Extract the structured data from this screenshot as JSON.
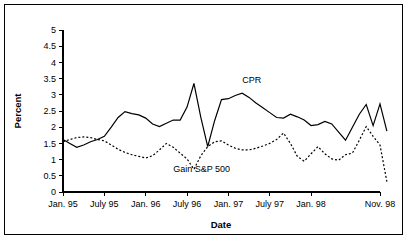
{
  "chart_data": {
    "type": "line",
    "title": "",
    "xlabel": "Date",
    "ylabel": "Percent",
    "ylim": [
      0,
      5
    ],
    "ytick_labels": [
      "0",
      "0.5",
      "1",
      "1.5",
      "2",
      "2.5",
      "3",
      "3.5",
      "4",
      "4.5",
      "5"
    ],
    "ytick_values": [
      0,
      0.5,
      1,
      1.5,
      2,
      2.5,
      3,
      3.5,
      4,
      4.5,
      5
    ],
    "xtick_labels": [
      "Jan. 95",
      "July 95",
      "Jan. 96",
      "July 96",
      "Jan. 97",
      "July 97",
      "Jan. 98",
      "Nov. 98"
    ],
    "xtick_index": [
      0,
      6,
      12,
      18,
      24,
      30,
      36,
      46
    ],
    "grid": false,
    "legend_position": "inline-annotation",
    "x_count": 47,
    "series": [
      {
        "name": "CPR",
        "style": "solid",
        "label_x_index": 26,
        "label_y_value": 3.35,
        "values": [
          1.62,
          1.5,
          1.38,
          1.45,
          1.55,
          1.62,
          1.72,
          2.0,
          2.3,
          2.48,
          2.42,
          2.38,
          2.28,
          2.1,
          2.02,
          2.12,
          2.22,
          2.22,
          2.62,
          3.35,
          2.3,
          1.4,
          2.2,
          2.85,
          2.88,
          2.98,
          3.05,
          2.92,
          2.75,
          2.6,
          2.45,
          2.3,
          2.28,
          2.4,
          2.32,
          2.22,
          2.05,
          2.08,
          2.18,
          2.1,
          1.85,
          1.6,
          2.0,
          2.4,
          2.7,
          2.05,
          2.72
        ]
      },
      {
        "name": "Gain S&P 500",
        "style": "dotted",
        "label_x_index": 16,
        "label_y_value": 0.62,
        "values": [
          1.55,
          1.62,
          1.68,
          1.7,
          1.68,
          1.62,
          1.58,
          1.45,
          1.32,
          1.22,
          1.15,
          1.1,
          1.05,
          1.12,
          1.3,
          1.5,
          1.38,
          1.2,
          1.02,
          0.7,
          1.12,
          1.4,
          1.55,
          1.58,
          1.45,
          1.35,
          1.3,
          1.3,
          1.35,
          1.42,
          1.5,
          1.62,
          1.82,
          1.5,
          1.1,
          0.95,
          1.18,
          1.4,
          1.18,
          1.02,
          0.98,
          1.15,
          1.2,
          1.6,
          2.02,
          1.72,
          1.45
        ]
      }
    ],
    "tail": {
      "note": "CPR ends at 1.88; Gain S&P 500 ends at 0.32",
      "cpr_end": 1.88,
      "gain_end": 0.32
    }
  },
  "colors": {
    "line": "#000000",
    "frame": "#000000",
    "background": "#ffffff"
  }
}
